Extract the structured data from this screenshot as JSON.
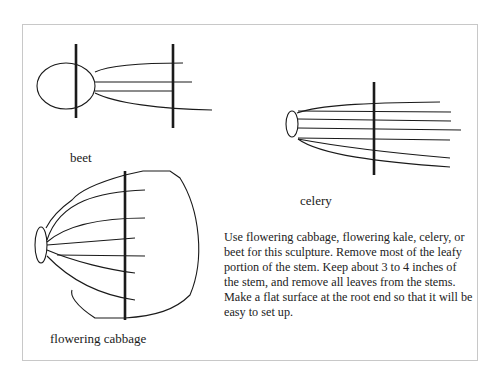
{
  "figure": {
    "labels": {
      "beet": "beet",
      "celery": "celery",
      "flowering_cabbage": "flowering cabbage"
    },
    "description": "Use flowering cabbage, flowering kale, celery, or beet for this sculpture. Remove most of the leafy portion of the stem. Keep about 3 to 4 inches of the stem, and remove all leaves from the stems. Make a flat surface at the root end so that it will be easy to set up."
  }
}
